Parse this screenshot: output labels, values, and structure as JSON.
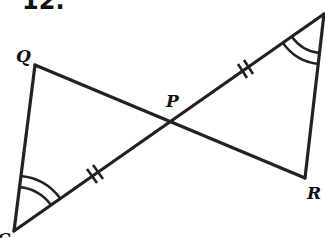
{
  "problem": {
    "number_label": "12."
  },
  "figure": {
    "stroke_color": "#222222",
    "points": {
      "Q": {
        "label": "Q",
        "x": 35,
        "y": 65
      },
      "P": {
        "label": "P",
        "x": 172,
        "y": 122
      },
      "R": {
        "label": "R",
        "x": 305,
        "y": 178
      },
      "top_right": {
        "label": "",
        "x": 324,
        "y": 14
      },
      "bottom_left": {
        "label": "C",
        "x": 14,
        "y": 231
      }
    },
    "segments": [
      {
        "from": "Q",
        "to": "R",
        "note": "passes through P"
      },
      {
        "from": "bottom_left",
        "to": "top_right",
        "note": "passes through P"
      },
      {
        "from": "Q",
        "to": "bottom_left"
      },
      {
        "from": "top_right",
        "to": "R"
      }
    ],
    "congruence_marks": {
      "double_ticks": [
        "segment P to top_right",
        "segment bottom_left to P"
      ],
      "double_arcs": [
        "angle at bottom_left",
        "angle at top_right"
      ]
    }
  }
}
